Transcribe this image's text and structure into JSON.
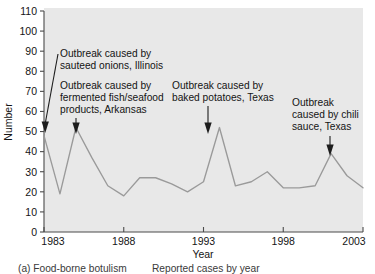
{
  "figure": {
    "caption": "(a) Food-borne botulism — Reported cases by year",
    "caption_part_a": "(a) Food-borne botulism",
    "caption_part_b": "Reported cases by year"
  },
  "chart_data": {
    "type": "line",
    "title": "",
    "subtitle": "",
    "xlabel": "Year",
    "ylabel": "Number",
    "xlim": [
      1983,
      2003
    ],
    "ylim": [
      0,
      110
    ],
    "grid": false,
    "legend": null,
    "legend_position": "none",
    "y_ticks": [
      0,
      10,
      20,
      30,
      40,
      50,
      60,
      70,
      80,
      90,
      100,
      110
    ],
    "y_tick_labels": [
      "0",
      "10",
      "20",
      "30",
      "40",
      "50",
      "60",
      "70",
      "80",
      "90",
      "100",
      "110"
    ],
    "x_ticks": [
      1983,
      1988,
      1993,
      1998,
      2003
    ],
    "x_tick_labels": [
      "1983",
      "1988",
      "1993",
      "1998",
      "2003"
    ],
    "x": [
      1983,
      1984,
      1985,
      1986,
      1987,
      1988,
      1989,
      1990,
      1991,
      1992,
      1993,
      1994,
      1995,
      1996,
      1997,
      1998,
      1999,
      2000,
      2001,
      2002,
      2003
    ],
    "values": [
      48,
      19,
      52,
      37,
      23,
      18,
      27,
      27,
      24,
      20,
      25,
      52,
      23,
      25,
      30,
      22,
      22,
      23,
      39,
      28,
      22
    ],
    "series": [
      {
        "name": "Reported cases",
        "color": "#9a9a9a",
        "values": [
          48,
          19,
          52,
          37,
          23,
          18,
          27,
          27,
          24,
          20,
          25,
          52,
          23,
          25,
          30,
          22,
          22,
          23,
          39,
          28,
          22
        ]
      }
    ],
    "plot_background_color": "#e8e8e8",
    "annotations": [
      {
        "id": "annot-sauteed-onions",
        "lines": [
          "Outbreak caused by",
          "sauteed onions, Illinois"
        ],
        "text": "Outbreak caused by sauteed onions, Illinois",
        "target_year": 1983,
        "target_value": 48
      },
      {
        "id": "annot-fermented-fish",
        "lines": [
          "Outbreak caused by",
          "fermented fish/seafood",
          "products, Arkansas"
        ],
        "text": "Outbreak caused by fermented fish/seafood products, Arkansas",
        "target_year": 1985,
        "target_value": 52
      },
      {
        "id": "annot-baked-potatoes",
        "lines": [
          "Outbreak caused by",
          "baked potatoes, Texas"
        ],
        "text": "Outbreak caused by baked potatoes, Texas",
        "target_year": 1994,
        "target_value": 52
      },
      {
        "id": "annot-chili-sauce",
        "lines": [
          "Outbreak",
          "caused by chili",
          "sauce, Texas"
        ],
        "text": "Outbreak caused by chili sauce, Texas",
        "target_year": 2001,
        "target_value": 39
      }
    ]
  }
}
